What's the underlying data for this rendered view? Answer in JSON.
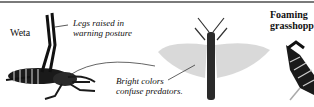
{
  "figure": {
    "labels": {
      "weta": "Weta",
      "legs_line1": "Legs raised in",
      "legs_line2": "warning posture",
      "bright_line1": "Bright colors",
      "bright_line2": "confuse predators.",
      "foaming_line1": "Foaming",
      "foaming_line2": "grasshopper"
    },
    "illustrations": [
      "weta-insect",
      "winged-grasshopper",
      "foaming-grasshopper"
    ],
    "colors": {
      "ink": "#111111",
      "rule": "#7a7a7a",
      "background": "#ffffff"
    }
  }
}
